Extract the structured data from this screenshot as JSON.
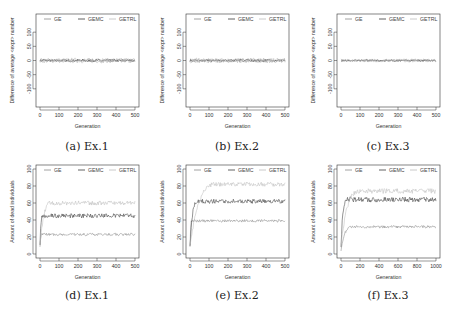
{
  "chart_data": [
    {
      "id": "a",
      "type": "line",
      "caption": "(a) Ex.1",
      "xlabel": "Generation",
      "ylabel": "Difference of average <expr> number",
      "xlim": [
        0,
        500
      ],
      "ylim": [
        -150,
        150
      ],
      "xticks": [
        0,
        100,
        200,
        300,
        400,
        500
      ],
      "yticks": [
        -100,
        -50,
        0,
        50,
        100
      ],
      "legend": [
        "GE",
        "GEMC",
        "GETRL"
      ],
      "legend_position": "top",
      "series": [
        {
          "name": "GE",
          "color": "#8a8a8a",
          "mean": 0,
          "noise": 6,
          "ramp": 0
        },
        {
          "name": "GEMC",
          "color": "#3a3a3a",
          "mean": 0,
          "noise": 4,
          "ramp": 0
        },
        {
          "name": "GETRL",
          "color": "#bdbdbd",
          "mean": 0,
          "noise": 9,
          "ramp": 0
        }
      ]
    },
    {
      "id": "b",
      "type": "line",
      "caption": "(b) Ex.2",
      "xlabel": "Generation",
      "ylabel": "Difference of average <expr> number",
      "xlim": [
        0,
        500
      ],
      "ylim": [
        -150,
        150
      ],
      "xticks": [
        0,
        100,
        200,
        300,
        400,
        500
      ],
      "yticks": [
        -100,
        -50,
        0,
        50,
        100
      ],
      "legend": [
        "GE",
        "GEMC",
        "GETRL"
      ],
      "legend_position": "top",
      "series": [
        {
          "name": "GE",
          "color": "#8a8a8a",
          "mean": 0,
          "noise": 6,
          "ramp": 0
        },
        {
          "name": "GEMC",
          "color": "#3a3a3a",
          "mean": 0,
          "noise": 4,
          "ramp": 0
        },
        {
          "name": "GETRL",
          "color": "#bdbdbd",
          "mean": 0,
          "noise": 9,
          "ramp": 0
        }
      ]
    },
    {
      "id": "c",
      "type": "line",
      "caption": "(c) Ex.3",
      "xlabel": "Generation",
      "ylabel": "Difference of average <expr> number",
      "xlim": [
        0,
        500
      ],
      "ylim": [
        -150,
        150
      ],
      "xticks": [
        0,
        100,
        200,
        300,
        400,
        500
      ],
      "yticks": [
        -100,
        -50,
        0,
        50,
        100
      ],
      "legend": [
        "GE",
        "GEMC",
        "GETRL"
      ],
      "legend_position": "top",
      "series": [
        {
          "name": "GE",
          "color": "#8a8a8a",
          "mean": 0,
          "noise": 4,
          "ramp": 0
        },
        {
          "name": "GEMC",
          "color": "#3a3a3a",
          "mean": 0,
          "noise": 3,
          "ramp": 0
        },
        {
          "name": "GETRL",
          "color": "#bdbdbd",
          "mean": 0,
          "noise": 6,
          "ramp": 0
        }
      ]
    },
    {
      "id": "d",
      "type": "line",
      "caption": "(d) Ex.1",
      "xlabel": "Generation",
      "ylabel": "Amount of dead individuals",
      "xlim": [
        0,
        500
      ],
      "ylim": [
        0,
        100
      ],
      "xticks": [
        0,
        100,
        200,
        300,
        400,
        500
      ],
      "yticks": [
        0,
        20,
        40,
        60,
        80,
        100
      ],
      "legend": [
        "GE",
        "GEMC",
        "GETRL"
      ],
      "legend_position": "top",
      "series": [
        {
          "name": "GE",
          "color": "#8a8a8a",
          "start": 10,
          "mean": 23,
          "noise": 1.5,
          "ramp": 10
        },
        {
          "name": "GEMC",
          "color": "#3a3a3a",
          "start": 10,
          "mean": 45,
          "noise": 2.5,
          "ramp": 15
        },
        {
          "name": "GETRL",
          "color": "#bdbdbd",
          "start": 10,
          "mean": 60,
          "noise": 2.5,
          "ramp": 60
        }
      ]
    },
    {
      "id": "e",
      "type": "line",
      "caption": "(e) Ex.2",
      "xlabel": "Generation",
      "ylabel": "Amount of dead individuals",
      "xlim": [
        0,
        500
      ],
      "ylim": [
        0,
        100
      ],
      "xticks": [
        0,
        100,
        200,
        300,
        400,
        500
      ],
      "yticks": [
        0,
        20,
        40,
        60,
        80,
        100
      ],
      "legend": [
        "GE",
        "GEMC",
        "GETRL"
      ],
      "legend_position": "top",
      "series": [
        {
          "name": "GE",
          "color": "#8a8a8a",
          "start": 10,
          "mean": 39,
          "noise": 1.5,
          "ramp": 10
        },
        {
          "name": "GEMC",
          "color": "#3a3a3a",
          "start": 10,
          "mean": 62,
          "noise": 2.5,
          "ramp": 40
        },
        {
          "name": "GETRL",
          "color": "#bdbdbd",
          "start": 10,
          "mean": 82,
          "noise": 2.5,
          "ramp": 140
        }
      ]
    },
    {
      "id": "f",
      "type": "line",
      "caption": "(f) Ex.3",
      "xlabel": "Generation",
      "ylabel": "Amount of dead individuals",
      "xlim": [
        0,
        1000
      ],
      "ylim": [
        0,
        100
      ],
      "xticks": [
        0,
        200,
        400,
        600,
        800,
        1000
      ],
      "yticks": [
        0,
        20,
        40,
        60,
        80,
        100
      ],
      "legend": [
        "GE",
        "GEMC",
        "GETRL"
      ],
      "legend_position": "top",
      "series": [
        {
          "name": "GE",
          "color": "#8a8a8a",
          "start": 5,
          "mean": 32,
          "noise": 1.5,
          "ramp": 120
        },
        {
          "name": "GEMC",
          "color": "#3a3a3a",
          "start": 10,
          "mean": 64,
          "noise": 3,
          "ramp": 60
        },
        {
          "name": "GETRL",
          "color": "#bdbdbd",
          "start": 10,
          "mean": 74,
          "noise": 3,
          "ramp": 200
        }
      ]
    }
  ]
}
